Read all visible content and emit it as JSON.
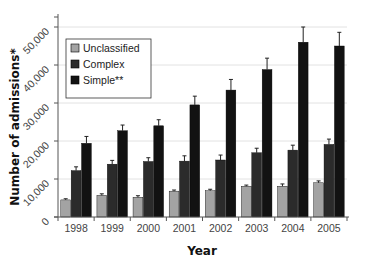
{
  "chart_data": {
    "type": "bar",
    "title": "",
    "xlabel": "Year",
    "ylabel": "Number of admissions*",
    "categories": [
      "1998",
      "1999",
      "2000",
      "2001",
      "2002",
      "2003",
      "2004",
      "2005"
    ],
    "series": [
      {
        "name": "Unclassified",
        "color": "#a3a3a3",
        "values": [
          4500,
          5700,
          5200,
          6800,
          6900,
          8100,
          8100,
          9000
        ],
        "errors": [
          300,
          400,
          400,
          300,
          400,
          300,
          600,
          500
        ]
      },
      {
        "name": "Complex",
        "color": "#2b2b2b",
        "values": [
          12200,
          13900,
          14600,
          14700,
          15000,
          16900,
          17600,
          19100
        ],
        "errors": [
          1000,
          1000,
          1000,
          1400,
          1300,
          1200,
          1300,
          1400
        ]
      },
      {
        "name": "Simple**",
        "color": "#121212",
        "values": [
          19400,
          22700,
          24000,
          29500,
          33400,
          38800,
          46000,
          45000
        ],
        "errors": [
          1800,
          1500,
          1600,
          2300,
          2800,
          3000,
          4000,
          3600
        ]
      }
    ],
    "yticks": [
      0,
      10000,
      20000,
      30000,
      40000,
      50000
    ],
    "ytick_labels": [
      "0",
      "10,000",
      "20,000",
      "30,000",
      "40,000",
      "50,000"
    ],
    "ylim": [
      0,
      52000
    ],
    "grid": true,
    "legend_position": "upper left, inside plot",
    "error_bars": true
  }
}
